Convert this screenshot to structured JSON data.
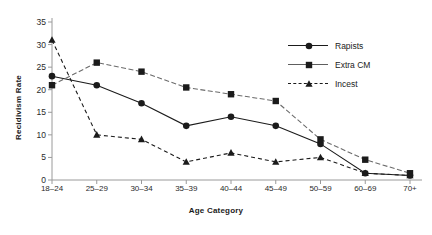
{
  "chart_data": {
    "type": "line",
    "title": "",
    "xlabel": "Age Category",
    "ylabel": "Recidivism Rate",
    "categories": [
      "18–24",
      "25–29",
      "30–34",
      "35–39",
      "40–44",
      "45–49",
      "50–59",
      "60–69",
      "70+"
    ],
    "yticks": [
      "0",
      "5",
      "10",
      "15",
      "20",
      "25",
      "30",
      "35"
    ],
    "ylim": [
      0,
      35
    ],
    "grid": false,
    "legend_position": "top-right",
    "series": [
      {
        "name": "Rapists",
        "marker": "circle",
        "linestyle": "solid",
        "color": "#1b1b1b",
        "values": [
          23,
          21,
          17,
          12,
          14,
          12,
          8,
          1.5,
          1
        ]
      },
      {
        "name": "Extra CM",
        "marker": "square",
        "linestyle": "solid-light",
        "color": "#1b1b1b",
        "values": [
          21,
          26,
          24,
          20.5,
          19,
          17.5,
          9,
          4.5,
          1.5
        ]
      },
      {
        "name": "Incest",
        "marker": "triangle",
        "linestyle": "dashed",
        "color": "#1b1b1b",
        "values": [
          31,
          10,
          9,
          4,
          6,
          4,
          5,
          1.5,
          1
        ]
      }
    ]
  }
}
